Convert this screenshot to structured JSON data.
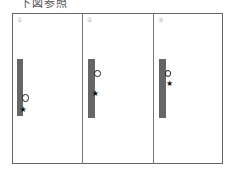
{
  "header": {
    "text": "下図参照"
  },
  "panels": [
    {
      "label": "①",
      "cols": 5,
      "rows": 5,
      "circle": {
        "row": 4,
        "col": 4
      },
      "star": {
        "row": 5,
        "col": 1
      }
    },
    {
      "label": "②",
      "cols": 6,
      "rows": 6,
      "circle": {
        "row": 2,
        "col": 6
      },
      "star": {
        "row": 4,
        "col": 3
      }
    },
    {
      "label": "③",
      "cols": 6,
      "rows": 6,
      "circle": {
        "row": 2,
        "col": 5
      },
      "star": {
        "row": 3,
        "col": 6
      }
    }
  ],
  "icons": {
    "circle": "circle-marker-icon",
    "star": "star-marker-icon"
  },
  "colors": {
    "grid": "#666666",
    "marker": "#222222",
    "label": "#aaaaaa"
  }
}
